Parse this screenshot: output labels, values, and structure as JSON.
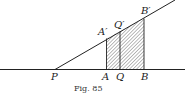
{
  "figure": {
    "caption": "Fig. 85",
    "points": {
      "P": "P",
      "A": "A",
      "Q": "Q",
      "B": "B",
      "A_prime": "A′",
      "Q_prime": "Q′",
      "B_prime": "B′"
    }
  }
}
